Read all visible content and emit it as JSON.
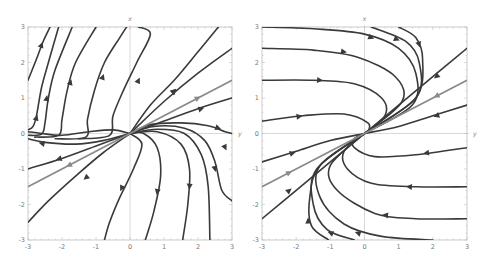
{
  "chart_data": [
    {
      "type": "streamplot",
      "title": "",
      "xlabel": "y",
      "ylabel": "x",
      "xlim": [
        -3,
        3
      ],
      "ylim": [
        -3,
        3
      ],
      "xticks": [
        -3,
        -2,
        -1,
        0,
        1,
        2,
        3
      ],
      "yticks": [
        -3,
        -2,
        -1,
        0,
        1,
        2,
        3
      ],
      "grid": false,
      "colors": {
        "stream": "#3a3a3a",
        "highlight": "#8a8a8a",
        "frame": "#bdbdbd"
      },
      "highlight_line": {
        "points": [
          [
            -3,
            -1.5
          ],
          [
            3,
            1.5
          ]
        ],
        "arrows": [
          [
            2.0,
            1.0,
            1
          ],
          [
            -1.8,
            -0.9,
            -1
          ]
        ]
      },
      "streamlines": [
        {
          "points": [
            [
              -3,
              1.5
            ],
            [
              -2.75,
              2.1
            ],
            [
              -2.55,
              2.6
            ],
            [
              -2.35,
              3
            ]
          ],
          "arrow": [
            -2.6,
            2.5
          ]
        },
        {
          "points": [
            [
              -3,
              0.1
            ],
            [
              -2.85,
              0.2
            ],
            [
              -2.75,
              0.5
            ],
            [
              -2.6,
              1.3
            ],
            [
              -2.4,
              2
            ],
            [
              -2.1,
              3
            ]
          ],
          "arrow": [
            -2.75,
            0.45
          ]
        },
        {
          "points": [
            [
              -3,
              -0.05
            ],
            [
              -2.6,
              -0.02
            ],
            [
              -2.5,
              0.3
            ],
            [
              -2.4,
              1.0
            ],
            [
              -2.2,
              1.8
            ],
            [
              -1.7,
              3
            ]
          ],
          "arrow": [
            -2.45,
            1.0
          ]
        },
        {
          "points": [
            [
              -2.8,
              -0.1
            ],
            [
              -2.1,
              -0.05
            ],
            [
              -2.0,
              0.4
            ],
            [
              -1.85,
              1.2
            ],
            [
              -1.6,
              2
            ],
            [
              -1.0,
              3
            ]
          ],
          "arrow": [
            -1.75,
            1.45
          ]
        },
        {
          "points": [
            [
              -2.2,
              -0.15
            ],
            [
              -1.3,
              -0.1
            ],
            [
              -1.25,
              0.4
            ],
            [
              -1.05,
              1.2
            ],
            [
              -0.75,
              2
            ],
            [
              -0.3,
              2.7
            ],
            [
              -0.1,
              3
            ]
          ],
          "arrow": [
            -0.8,
            1.6
          ]
        },
        {
          "points": [
            [
              -1.5,
              -0.15
            ],
            [
              -0.6,
              -0.05
            ],
            [
              -0.5,
              0.5
            ],
            [
              -0.2,
              1.2
            ],
            [
              0.2,
              2
            ],
            [
              0.6,
              2.8
            ],
            [
              0.25,
              3
            ]
          ],
          "arrow": [
            0.25,
            1.5
          ]
        },
        {
          "points": [
            [
              0,
              0
            ],
            [
              0.6,
              0.8
            ],
            [
              1.3,
              1.5
            ],
            [
              2.0,
              2.3
            ],
            [
              2.6,
              3
            ]
          ],
          "arrow": [
            1.3,
            1.2
          ]
        },
        {
          "points": [
            [
              0,
              0
            ],
            [
              1,
              0.9
            ],
            [
              2,
              1.7
            ],
            [
              3,
              2.4
            ]
          ],
          "arrow": [
            1.3,
            1.2
          ]
        },
        {
          "points": [
            [
              0,
              0
            ],
            [
              1,
              0.35
            ],
            [
              2,
              0.7
            ],
            [
              3,
              1.0
            ]
          ],
          "arrow": [
            2.1,
            0.7
          ]
        },
        {
          "points": [
            [
              0,
              0
            ],
            [
              0.6,
              0.25
            ],
            [
              1.5,
              0.3
            ],
            [
              2.3,
              0.22
            ],
            [
              2.8,
              0.05
            ],
            [
              3,
              0
            ]
          ],
          "arrow": [
            2.6,
            0.15
          ]
        },
        {
          "points": [
            [
              0,
              0
            ],
            [
              0.7,
              0.2
            ],
            [
              1.6,
              0.15
            ],
            [
              2.2,
              -0.2
            ],
            [
              2.5,
              -0.8
            ],
            [
              2.7,
              -1.6
            ],
            [
              3,
              -1.9
            ]
          ],
          "arrow": [
            2.8,
            -0.4
          ]
        },
        {
          "points": [
            [
              0,
              0
            ],
            [
              0.8,
              0.12
            ],
            [
              1.6,
              0
            ],
            [
              2.1,
              -0.6
            ],
            [
              2.3,
              -1.5
            ],
            [
              2.35,
              -3
            ]
          ],
          "arrow": [
            2.5,
            -1.0
          ]
        },
        {
          "points": [
            [
              0,
              0
            ],
            [
              0.8,
              0.05
            ],
            [
              1.5,
              -0.3
            ],
            [
              1.75,
              -1
            ],
            [
              1.7,
              -2
            ],
            [
              1.55,
              -3
            ]
          ],
          "arrow": [
            1.75,
            -1.5
          ]
        },
        {
          "points": [
            [
              0,
              0
            ],
            [
              0.4,
              0
            ],
            [
              0.8,
              -0.4
            ],
            [
              0.9,
              -1.2
            ],
            [
              0.7,
              -2.2
            ],
            [
              0.45,
              -3
            ]
          ],
          "arrow": [
            0.8,
            -1.65
          ]
        },
        {
          "points": [
            [
              0,
              0
            ],
            [
              0.35,
              -0.3
            ],
            [
              0.1,
              -1
            ],
            [
              -0.3,
              -1.8
            ],
            [
              -0.6,
              -2.5
            ],
            [
              -0.75,
              -3
            ]
          ],
          "arrow": [
            -0.25,
            -1.55
          ]
        },
        {
          "points": [
            [
              0,
              0
            ],
            [
              -0.8,
              -0.55
            ],
            [
              -1.6,
              -1.2
            ],
            [
              -2.4,
              -1.9
            ],
            [
              -3,
              -2.5
            ]
          ],
          "arrow": [
            -1.3,
            -1.25
          ]
        },
        {
          "points": [
            [
              0,
              0
            ],
            [
              -1,
              -0.35
            ],
            [
              -2,
              -0.7
            ],
            [
              -3,
              -1.0
            ]
          ],
          "arrow": [
            -2.1,
            -0.72
          ]
        },
        {
          "points": [
            [
              0,
              0
            ],
            [
              -0.8,
              -0.2
            ],
            [
              -1.6,
              -0.3
            ],
            [
              -2.5,
              -0.25
            ],
            [
              -3,
              -0.15
            ]
          ],
          "arrow": [
            -2.6,
            -0.28
          ]
        },
        {
          "points": [
            [
              0,
              0
            ],
            [
              -0.5,
              0.1
            ],
            [
              -1.2,
              0.05
            ],
            [
              -2.0,
              -0.05
            ],
            [
              -2.6,
              0
            ],
            [
              -3,
              0.05
            ]
          ],
          "arrow": null
        }
      ]
    },
    {
      "type": "streamplot",
      "title": "",
      "xlabel": "y",
      "ylabel": "x",
      "xlim": [
        -3,
        3
      ],
      "ylim": [
        -3,
        3
      ],
      "xticks": [
        -3,
        -2,
        -1,
        0,
        1,
        2,
        3
      ],
      "yticks": [
        -3,
        -2,
        -1,
        0,
        1,
        2,
        3
      ],
      "grid": false,
      "colors": {
        "stream": "#3a3a3a",
        "highlight": "#8a8a8a",
        "frame": "#bdbdbd"
      },
      "highlight_line": {
        "points": [
          [
            -3,
            -1.5
          ],
          [
            3,
            1.5
          ]
        ],
        "arrows": [
          [
            2.1,
            1.05,
            -1
          ],
          [
            -2.2,
            -1.1,
            1
          ]
        ]
      },
      "streamlines": [
        {
          "points": [
            [
              -3,
              3
            ],
            [
              -1.5,
              2.95
            ],
            [
              0,
              2.8
            ],
            [
              1,
              2.4
            ],
            [
              1.5,
              1.7
            ],
            [
              1.4,
              0.8
            ],
            [
              0,
              0
            ]
          ],
          "arrow": [
            0.2,
            2.7
          ]
        },
        {
          "points": [
            [
              -3,
              2.4
            ],
            [
              -1.5,
              2.35
            ],
            [
              -0.2,
              2.15
            ],
            [
              0.9,
              1.6
            ],
            [
              1.1,
              0.9
            ],
            [
              0,
              0
            ]
          ],
          "arrow": [
            -0.6,
            2.3
          ]
        },
        {
          "points": [
            [
              -3,
              1.5
            ],
            [
              -1.5,
              1.5
            ],
            [
              -0.3,
              1.4
            ],
            [
              0.5,
              1.0
            ],
            [
              0.6,
              0.5
            ],
            [
              0,
              0
            ]
          ],
          "arrow": [
            -1.3,
            1.5
          ]
        },
        {
          "points": [
            [
              -3,
              0.35
            ],
            [
              -1.8,
              0.5
            ],
            [
              -0.6,
              0.55
            ],
            [
              0.1,
              0.3
            ],
            [
              0.1,
              0.05
            ],
            [
              0,
              0
            ]
          ],
          "arrow": [
            -1.9,
            0.48
          ]
        },
        {
          "points": [
            [
              0.2,
              3
            ],
            [
              1.2,
              2.6
            ],
            [
              1.6,
              2.0
            ],
            [
              1.5,
              1.0
            ],
            [
              0,
              0
            ]
          ],
          "arrow": [
            0.95,
            2.65
          ]
        },
        {
          "points": [
            [
              1.0,
              3
            ],
            [
              1.5,
              2.7
            ],
            [
              1.7,
              2.1
            ],
            [
              1.5,
              1.0
            ],
            [
              0,
              0
            ]
          ],
          "arrow": [
            1.6,
            2.5
          ]
        },
        {
          "points": [
            [
              3,
              2.4
            ],
            [
              2,
              1.6
            ],
            [
              1,
              0.8
            ],
            [
              0,
              0
            ]
          ],
          "arrow": [
            2.1,
            1.6
          ]
        },
        {
          "points": [
            [
              3,
              0.8
            ],
            [
              2,
              0.5
            ],
            [
              1,
              0.2
            ],
            [
              0,
              0
            ]
          ],
          "arrow": [
            2.1,
            0.5
          ]
        },
        {
          "points": [
            [
              -3,
              -0.8
            ],
            [
              -2,
              -0.5
            ],
            [
              -1,
              -0.2
            ],
            [
              0,
              0
            ]
          ],
          "arrow": [
            -2.1,
            -0.55
          ]
        },
        {
          "points": [
            [
              -3,
              -2.4
            ],
            [
              -2,
              -1.6
            ],
            [
              -1,
              -0.8
            ],
            [
              0,
              0
            ]
          ],
          "arrow": [
            -2.2,
            -1.6
          ]
        },
        {
          "points": [
            [
              3,
              -0.4
            ],
            [
              1.5,
              -0.6
            ],
            [
              0.3,
              -0.65
            ],
            [
              -0.3,
              -0.4
            ],
            [
              -0.3,
              -0.15
            ],
            [
              0,
              0
            ]
          ],
          "arrow": [
            1.8,
            -0.55
          ]
        },
        {
          "points": [
            [
              3,
              -1.5
            ],
            [
              1.5,
              -1.5
            ],
            [
              0.2,
              -1.4
            ],
            [
              -0.5,
              -1.0
            ],
            [
              -0.6,
              -0.5
            ],
            [
              0,
              0
            ]
          ],
          "arrow": [
            1.3,
            -1.5
          ]
        },
        {
          "points": [
            [
              3,
              -2.4
            ],
            [
              1.5,
              -2.4
            ],
            [
              0.3,
              -2.25
            ],
            [
              -0.8,
              -1.6
            ],
            [
              -1.0,
              -0.9
            ],
            [
              0,
              0
            ]
          ],
          "arrow": [
            0.6,
            -2.3
          ]
        },
        {
          "points": [
            [
              2,
              -3
            ],
            [
              0.5,
              -2.9
            ],
            [
              -0.6,
              -2.55
            ],
            [
              -1.3,
              -1.8
            ],
            [
              -1.3,
              -0.9
            ],
            [
              0,
              0
            ]
          ],
          "arrow": [
            -0.2,
            -2.8
          ]
        },
        {
          "points": [
            [
              -0.3,
              -3
            ],
            [
              -1.1,
              -2.7
            ],
            [
              -1.5,
              -2.0
            ],
            [
              -1.4,
              -1.0
            ],
            [
              0,
              0
            ]
          ],
          "arrow": [
            -1.0,
            -2.8
          ]
        },
        {
          "points": [
            [
              -1.05,
              -3
            ],
            [
              -1.55,
              -2.6
            ],
            [
              -1.6,
              -1.8
            ],
            [
              -1.3,
              -0.9
            ],
            [
              0,
              0
            ]
          ],
          "arrow": [
            -1.65,
            -2.45
          ]
        }
      ]
    }
  ],
  "plots": [
    {
      "top_label": "x",
      "right_label": "y",
      "tick_labels": [
        "-3",
        "-2",
        "-1",
        "0",
        "1",
        "2",
        "3"
      ]
    },
    {
      "top_label": "x",
      "right_label": "y",
      "tick_labels": [
        "-3",
        "-2",
        "-1",
        "0",
        "1",
        "2",
        "3"
      ]
    }
  ]
}
